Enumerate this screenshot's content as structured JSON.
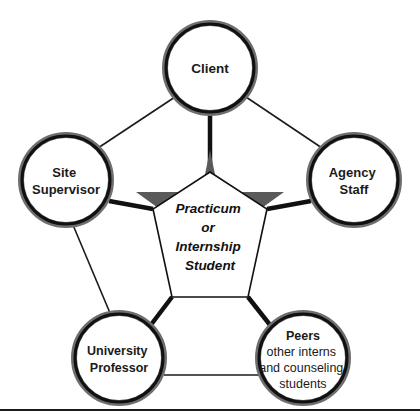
{
  "diagram": {
    "title_text": "",
    "center": {
      "name": "practicum-or-internship-student",
      "lines": [
        "Practicum",
        "or",
        "Internship",
        "Student"
      ],
      "shape": "pentagon-over-pentagram",
      "pentagon_fill": "#ffffff",
      "star_fill": "#5a5a5a",
      "outline": "#111111"
    },
    "nodes": [
      {
        "id": "client",
        "lines": [
          "Client"
        ],
        "bold_lines": 1,
        "cx": 210,
        "cy": 68,
        "r": 45
      },
      {
        "id": "site-supervisor",
        "lines": [
          "Site",
          "Supervisor"
        ],
        "bold_lines": 2,
        "cx": 66,
        "cy": 180,
        "r": 45
      },
      {
        "id": "agency-staff",
        "lines": [
          "Agency",
          "Staff"
        ],
        "bold_lines": 2,
        "cx": 354,
        "cy": 180,
        "r": 45
      },
      {
        "id": "university-professor",
        "lines": [
          "University",
          "Professor"
        ],
        "bold_lines": 2,
        "cx": 119,
        "cy": 358,
        "r": 45
      },
      {
        "id": "peers",
        "lines": [
          "Peers",
          "other interns",
          "and counseling",
          "students"
        ],
        "bold_lines": 1,
        "cx": 303,
        "cy": 358,
        "r": 45
      }
    ],
    "spokes": [
      {
        "from": "client",
        "to": "center",
        "weight": "thick"
      },
      {
        "from": "site-supervisor",
        "to": "center",
        "weight": "thick"
      },
      {
        "from": "agency-staff",
        "to": "center",
        "weight": "thick"
      },
      {
        "from": "university-professor",
        "to": "center",
        "weight": "thick"
      },
      {
        "from": "peers",
        "to": "center",
        "weight": "thick"
      }
    ],
    "perimeter_links": [
      {
        "from": "site-supervisor",
        "to": "client",
        "weight": "thin"
      },
      {
        "from": "client",
        "to": "agency-staff",
        "weight": "thin"
      },
      {
        "from": "site-supervisor",
        "to": "university-professor",
        "weight": "thin"
      },
      {
        "from": "university-professor",
        "to": "peers",
        "weight": "thin"
      }
    ],
    "footer_rule": true,
    "colors": {
      "ring_outer": "#6e6e6e",
      "ring_inner": "#111111",
      "line": "#1a1a1a",
      "star": "#5a5a5a",
      "text": "#111111",
      "background": "#ffffff"
    }
  }
}
